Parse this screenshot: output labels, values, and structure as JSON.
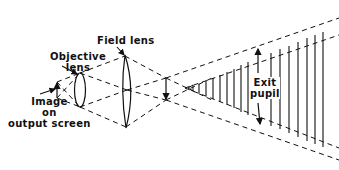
{
  "diagram": {
    "type": "optical-ray-diagram",
    "labels": {
      "field_lens": "Field lens",
      "objective_lens_line1": "Objective",
      "objective_lens_line2": "lens",
      "image_line1": "Image",
      "image_line2": "on",
      "image_line3": "output screen",
      "exit_pupil_line1": "Exit",
      "exit_pupil_line2": "pupil"
    },
    "elements": [
      {
        "name": "image-on-output-screen",
        "kind": "arrow"
      },
      {
        "name": "objective-lens",
        "kind": "lens"
      },
      {
        "name": "field-lens",
        "kind": "lens"
      },
      {
        "name": "intermediate-image",
        "kind": "arrow"
      },
      {
        "name": "exit-pupil",
        "kind": "region-with-vertical-lines"
      }
    ],
    "colors": {
      "line": "#111111",
      "background": "#ffffff"
    }
  }
}
